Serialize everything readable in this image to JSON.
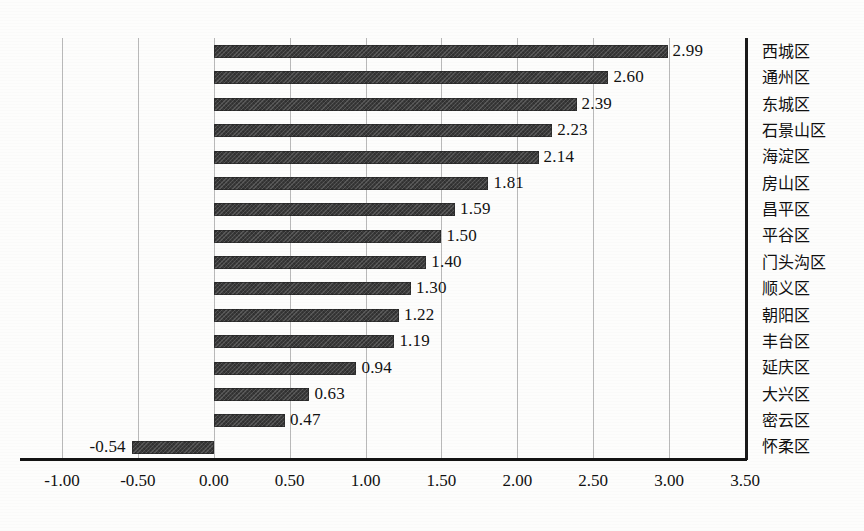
{
  "chart_data": {
    "type": "bar",
    "orientation": "horizontal",
    "title": "",
    "subtitle": "",
    "xlabel": "",
    "ylabel": "",
    "xlim": [
      -1.0,
      3.5
    ],
    "xticks": [
      "-1.00",
      "-0.50",
      "0.00",
      "0.50",
      "1.00",
      "1.50",
      "2.00",
      "2.50",
      "3.00",
      "3.50"
    ],
    "xtick_values": [
      -1.0,
      -0.5,
      0.0,
      0.5,
      1.0,
      1.5,
      2.0,
      2.5,
      3.0,
      3.5
    ],
    "grid": "vertical",
    "legend": "none",
    "categories": [
      "西城区",
      "通州区",
      "东城区",
      "石景山区",
      "海淀区",
      "房山区",
      "昌平区",
      "平谷区",
      "门头沟区",
      "顺义区",
      "朝阳区",
      "丰台区",
      "延庆区",
      "大兴区",
      "密云区",
      "怀柔区"
    ],
    "values": [
      2.99,
      2.6,
      2.39,
      2.23,
      2.14,
      1.81,
      1.59,
      1.5,
      1.4,
      1.3,
      1.22,
      1.19,
      0.94,
      0.63,
      0.47,
      -0.54
    ],
    "value_labels": [
      "2.99",
      "2.60",
      "2.39",
      "2.23",
      "2.14",
      "1.81",
      "1.59",
      "1.50",
      "1.40",
      "1.30",
      "1.22",
      "1.19",
      "0.94",
      "0.63",
      "0.47",
      "-0.54"
    ],
    "bar_color": "#3a3a3a",
    "gridline_color": "#b9b9b9",
    "axis_color": "#141414"
  }
}
